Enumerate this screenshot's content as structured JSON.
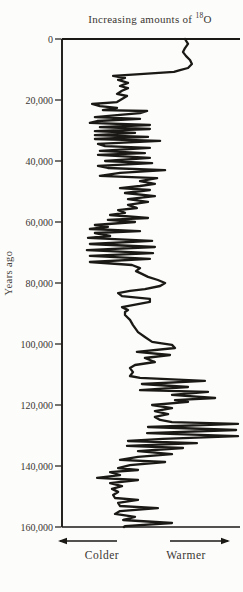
{
  "title": {
    "prefix": "Increasing amounts of ",
    "isotope_mass": "18",
    "element": "O"
  },
  "y_axis": {
    "label": "Years ago",
    "tick_labels": [
      "0",
      "20,000",
      "40,000",
      "60,000",
      "80,000",
      "100,000",
      "120,000",
      "140,000",
      "160,000"
    ],
    "tick_values": [
      0,
      20000,
      40000,
      60000,
      80000,
      100000,
      120000,
      140000,
      160000
    ]
  },
  "x_axis": {
    "left_label": "Colder",
    "right_label": "Warmer"
  },
  "colors": {
    "ink": "#1b1916",
    "text": "#3a3632",
    "background": "#fcfcfa"
  },
  "chart_data": {
    "type": "line",
    "title": "Increasing amounts of 18O",
    "orientation": "vertical-depth",
    "ylabel": "Years ago",
    "ylim": [
      0,
      160000
    ],
    "xlabel": "relative 18O amount (0 = colder/left, 100 = warmer/right)",
    "xlim": [
      0,
      100
    ],
    "x_annotations": [
      "Colder",
      "Warmer"
    ],
    "grid": false,
    "legend": "none",
    "points": [
      [
        0,
        69.1
      ],
      [
        1600,
        70.8
      ],
      [
        3000,
        69.1
      ],
      [
        4300,
        68.0
      ],
      [
        5600,
        69.7
      ],
      [
        6900,
        71.9
      ],
      [
        8200,
        73.0
      ],
      [
        9500,
        70.8
      ],
      [
        10200,
        66.3
      ],
      [
        10800,
        62.9
      ],
      [
        11500,
        43.8
      ],
      [
        12100,
        28.7
      ],
      [
        12800,
        35.4
      ],
      [
        13400,
        31.5
      ],
      [
        14400,
        37.1
      ],
      [
        15400,
        32.6
      ],
      [
        16100,
        37.1
      ],
      [
        17000,
        33.7
      ],
      [
        18000,
        30.9
      ],
      [
        18700,
        36.5
      ],
      [
        19700,
        33.7
      ],
      [
        20700,
        30.9
      ],
      [
        21300,
        16.9
      ],
      [
        22000,
        21.3
      ],
      [
        22600,
        30.9
      ],
      [
        23300,
        23.0
      ],
      [
        23600,
        47.8
      ],
      [
        24300,
        43.8
      ],
      [
        24900,
        32.6
      ],
      [
        25600,
        18.5
      ],
      [
        26200,
        43.8
      ],
      [
        26900,
        19.7
      ],
      [
        27500,
        15.7
      ],
      [
        28200,
        49.4
      ],
      [
        28900,
        21.3
      ],
      [
        29500,
        49.4
      ],
      [
        30200,
        18.5
      ],
      [
        30800,
        41.0
      ],
      [
        31500,
        18.5
      ],
      [
        32100,
        48.3
      ],
      [
        32800,
        18.5
      ],
      [
        33400,
        55.1
      ],
      [
        34400,
        20.2
      ],
      [
        35100,
        24.2
      ],
      [
        35700,
        49.4
      ],
      [
        36700,
        21.3
      ],
      [
        37400,
        46.6
      ],
      [
        38000,
        20.2
      ],
      [
        39000,
        49.4
      ],
      [
        40000,
        24.2
      ],
      [
        40700,
        50.6
      ],
      [
        41600,
        20.2
      ],
      [
        42300,
        25.8
      ],
      [
        43000,
        57.9
      ],
      [
        43900,
        32.6
      ],
      [
        44900,
        21.3
      ],
      [
        45600,
        53.4
      ],
      [
        46600,
        43.8
      ],
      [
        47500,
        52.2
      ],
      [
        48200,
        43.8
      ],
      [
        48900,
        32.6
      ],
      [
        49500,
        49.4
      ],
      [
        50500,
        35.4
      ],
      [
        51500,
        52.2
      ],
      [
        52500,
        37.1
      ],
      [
        53400,
        48.3
      ],
      [
        54400,
        37.1
      ],
      [
        55400,
        42.1
      ],
      [
        56100,
        31.5
      ],
      [
        57000,
        35.4
      ],
      [
        57700,
        27.0
      ],
      [
        58700,
        48.3
      ],
      [
        59300,
        25.8
      ],
      [
        60000,
        41.0
      ],
      [
        61000,
        18.5
      ],
      [
        61600,
        25.8
      ],
      [
        62300,
        15.7
      ],
      [
        63000,
        43.8
      ],
      [
        63600,
        18.5
      ],
      [
        64600,
        27.0
      ],
      [
        65200,
        14.6
      ],
      [
        66200,
        50.6
      ],
      [
        67200,
        15.7
      ],
      [
        68200,
        52.2
      ],
      [
        69200,
        14.0
      ],
      [
        70200,
        51.1
      ],
      [
        71100,
        15.7
      ],
      [
        72100,
        49.4
      ],
      [
        73100,
        15.7
      ],
      [
        74100,
        39.3
      ],
      [
        75100,
        43.8
      ],
      [
        76100,
        41.6
      ],
      [
        77000,
        44.9
      ],
      [
        78000,
        48.3
      ],
      [
        79000,
        53.9
      ],
      [
        80000,
        57.9
      ],
      [
        81000,
        55.1
      ],
      [
        82000,
        46.6
      ],
      [
        82600,
        38.2
      ],
      [
        83300,
        31.5
      ],
      [
        84300,
        33.7
      ],
      [
        85200,
        49.4
      ],
      [
        86200,
        49.4
      ],
      [
        87900,
        33.7
      ],
      [
        88900,
        37.1
      ],
      [
        89500,
        35.4
      ],
      [
        90500,
        35.4
      ],
      [
        92100,
        38.2
      ],
      [
        93800,
        39.9
      ],
      [
        96100,
        42.7
      ],
      [
        97700,
        46.6
      ],
      [
        99300,
        50.6
      ],
      [
        99700,
        55.1
      ],
      [
        100300,
        61.8
      ],
      [
        101300,
        63.5
      ],
      [
        102600,
        42.1
      ],
      [
        103600,
        60.7
      ],
      [
        104600,
        46.6
      ],
      [
        105900,
        52.2
      ],
      [
        106900,
        41.0
      ],
      [
        107900,
        38.2
      ],
      [
        109200,
        39.9
      ],
      [
        110500,
        38.2
      ],
      [
        111100,
        43.8
      ],
      [
        112100,
        80.3
      ],
      [
        113100,
        44.9
      ],
      [
        114100,
        70.8
      ],
      [
        115100,
        43.8
      ],
      [
        115700,
        82.0
      ],
      [
        116700,
        61.8
      ],
      [
        117700,
        86.0
      ],
      [
        118400,
        63.5
      ],
      [
        119000,
        70.8
      ],
      [
        120000,
        50.6
      ],
      [
        121000,
        61.8
      ],
      [
        122000,
        52.2
      ],
      [
        123000,
        59.6
      ],
      [
        123900,
        52.2
      ],
      [
        124900,
        55.1
      ],
      [
        125600,
        61.8
      ],
      [
        126200,
        98.9
      ],
      [
        127200,
        48.3
      ],
      [
        128200,
        97.8
      ],
      [
        129200,
        47.8
      ],
      [
        130200,
        98.9
      ],
      [
        131100,
        56.7
      ],
      [
        131800,
        37.1
      ],
      [
        132500,
        75.8
      ],
      [
        133400,
        36.5
      ],
      [
        134100,
        68.0
      ],
      [
        135100,
        42.7
      ],
      [
        136100,
        61.8
      ],
      [
        137000,
        42.7
      ],
      [
        138000,
        32.6
      ],
      [
        138700,
        57.9
      ],
      [
        139700,
        38.2
      ],
      [
        140700,
        31.5
      ],
      [
        141300,
        42.7
      ],
      [
        142000,
        27.0
      ],
      [
        143000,
        32.6
      ],
      [
        143900,
        19.7
      ],
      [
        144600,
        42.7
      ],
      [
        145600,
        27.0
      ],
      [
        146600,
        33.7
      ],
      [
        147500,
        28.1
      ],
      [
        148500,
        31.5
      ],
      [
        149500,
        28.7
      ],
      [
        150500,
        29.8
      ],
      [
        151100,
        42.7
      ],
      [
        152100,
        31.5
      ],
      [
        153100,
        32.6
      ],
      [
        153800,
        53.9
      ],
      [
        154800,
        32.6
      ],
      [
        155700,
        29.8
      ],
      [
        156700,
        41.0
      ],
      [
        157700,
        34.3
      ],
      [
        158700,
        61.8
      ],
      [
        159700,
        35.4
      ],
      [
        160000,
        34.8
      ]
    ]
  }
}
